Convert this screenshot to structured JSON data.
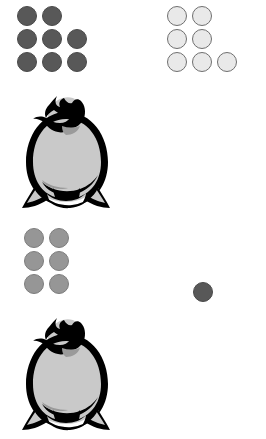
{
  "scene": {
    "title": "Penguin token groups",
    "background_color": "#ffffff",
    "layout": "2x2 grid of panels; each panel shows a group of round tokens above a penguin figure"
  },
  "palette": {
    "token_dark": "#585858",
    "token_mid": "#969696",
    "token_light": "#e9e9e9",
    "token_outline": "#4a4a4a",
    "penguin_outline": "#000000",
    "penguin_body": "#c9c9c9",
    "penguin_shadow": "#9a9a9a"
  },
  "panels": [
    {
      "id": "top-left",
      "position": "top-left",
      "token_color_name": "dark",
      "token_color": "#585858",
      "token_count": 8,
      "token_rows": [
        [
          "dark",
          "dark",
          "blank"
        ],
        [
          "dark",
          "dark",
          "dark"
        ],
        [
          "dark",
          "dark",
          "dark"
        ]
      ],
      "figure": "penguin"
    },
    {
      "id": "top-right",
      "position": "top-right",
      "token_color_name": "light",
      "token_color": "#e9e9e9",
      "token_count": 7,
      "token_rows": [
        [
          "light",
          "light",
          "blank"
        ],
        [
          "light",
          "light",
          "blank"
        ],
        [
          "light",
          "light",
          "light"
        ]
      ],
      "figure": "penguin"
    },
    {
      "id": "bottom-left",
      "position": "bottom-left",
      "token_color_name": "mid",
      "token_color": "#969696",
      "token_count": 6,
      "token_rows": [
        [
          "mid",
          "mid",
          "blank"
        ],
        [
          "mid",
          "mid",
          "blank"
        ],
        [
          "mid",
          "mid",
          "blank"
        ]
      ],
      "figure": "penguin"
    },
    {
      "id": "bottom-right",
      "position": "bottom-right",
      "token_color_name": "dark",
      "token_color": "#585858",
      "token_count": 1,
      "token_rows": [
        [
          "dark",
          "blank",
          "blank"
        ]
      ],
      "figure": "penguin"
    }
  ]
}
